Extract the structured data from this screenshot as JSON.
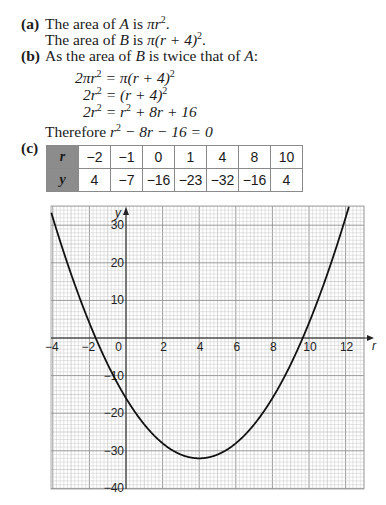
{
  "part_a": {
    "label": "(a)",
    "line1_pre": "The area of ",
    "line1_var": "A",
    "line1_mid": " is ",
    "line1_expr": "πr",
    "line1_post": ".",
    "line2_pre": "The area of ",
    "line2_var": "B",
    "line2_mid": " is ",
    "line2_expr": "π(r + 4)",
    "line2_post": "."
  },
  "part_b": {
    "label": "(b)",
    "intro_pre": "As the area of ",
    "intro_var1": "B",
    "intro_mid": " is twice that of ",
    "intro_var2": "A",
    "intro_post": ":",
    "eq1_lhs": "2πr",
    "eq1_rhs": " = π(r + 4)",
    "eq2_lhs": "2r",
    "eq2_rhs": " = (r + 4)",
    "eq3_lhs": "2r",
    "eq3_rhs_a": " = r",
    "eq3_rhs_b": " + 8r + 16",
    "conclusion_pre": "Therefore ",
    "conclusion_r": "r",
    "conclusion_post": " − 8r − 16 = 0",
    "sq": "2"
  },
  "part_c": {
    "label": "(c)",
    "table": {
      "row_headers": [
        "r",
        "y"
      ],
      "r_values": [
        "−2",
        "−1",
        "0",
        "1",
        "4",
        "8",
        "10"
      ],
      "y_values": [
        "4",
        "−7",
        "−16",
        "−23",
        "−32",
        "−16",
        "4"
      ]
    }
  },
  "chart_data": {
    "type": "line",
    "title": "",
    "function": "y = r^2 - 8r - 16",
    "xlabel": "r",
    "ylabel": "y",
    "xlim": [
      -4,
      13
    ],
    "ylim": [
      -40,
      35
    ],
    "x_ticks": [
      -4,
      -2,
      0,
      2,
      4,
      6,
      8,
      10,
      12
    ],
    "x_tick_labels": [
      "−4",
      "−2",
      "0",
      "2",
      "4",
      "6",
      "8",
      "10",
      "12"
    ],
    "y_ticks": [
      30,
      20,
      10,
      -10,
      -20,
      -30,
      -40
    ],
    "y_tick_labels": [
      "30",
      "20",
      "10",
      "−10",
      "−20",
      "−30",
      "−40"
    ],
    "grid": true,
    "series": [
      {
        "name": "y = r² − 8r − 16",
        "x": [
          -2,
          -1,
          0,
          1,
          4,
          8,
          10
        ],
        "values": [
          4,
          -7,
          -16,
          -23,
          -32,
          -16,
          4
        ]
      }
    ],
    "annotations": [
      "minimum at (4, −32)",
      "roots near r ≈ −1.66 and r ≈ 9.66"
    ]
  },
  "colors": {
    "text": "#1a1a1a",
    "table_header_bg": "#8c8c8c",
    "grid_minor": "#c8c8c8",
    "grid_major": "#8f8f8f",
    "curve": "#111111"
  }
}
